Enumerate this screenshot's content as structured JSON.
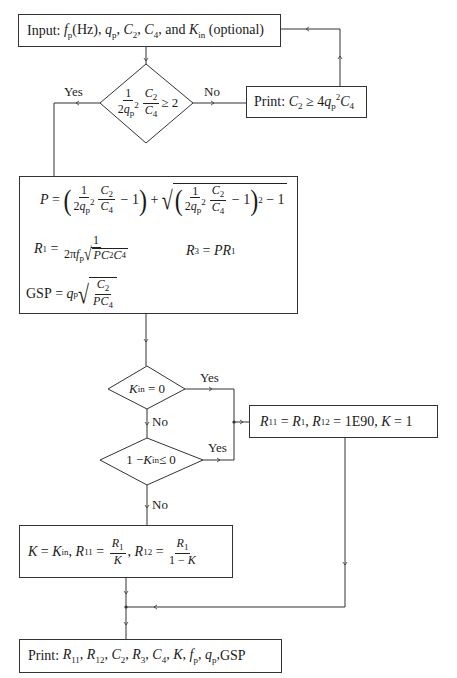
{
  "diagram": {
    "type": "flowchart",
    "nodes": {
      "input": {
        "kind": "process",
        "text": "Input: f_p(Hz), q_p, C_2, C_4, and K_in (optional)",
        "prefix": "Input: ",
        "items": [
          "f",
          "p",
          "(Hz), ",
          "q",
          "p",
          ", ",
          "C",
          "2",
          ", ",
          "C",
          "4",
          ", and ",
          "K",
          "in",
          " (optional)"
        ]
      },
      "check_ratio": {
        "kind": "decision",
        "text": "(1/(2q_p^2))(C_2/C_4) ≥ 2",
        "rhs": "≥ 2",
        "num1": "1",
        "den1": "2q",
        "num2": "C",
        "den2": "C"
      },
      "print_error": {
        "kind": "output",
        "text": "Print: C_2 ≥ 4q_p^2 C_4",
        "prefix": "Print: "
      },
      "compute": {
        "kind": "process",
        "lines": [
          "P = ((1/(2q_p^2))(C_2/C_4) − 1) + sqrt(((1/(2q_p^2))(C_2/C_4) − 1)^2 − 1)",
          "R_1 = 1/(2π f_p sqrt(P C_2 C_4))",
          "R_3 = P R_1",
          "GSP = q_p sqrt(C_2/(P C_4))"
        ]
      },
      "check_kin_zero": {
        "kind": "decision",
        "text": "K_in = 0",
        "rhs": "= 0"
      },
      "check_kin_ge_one": {
        "kind": "decision",
        "text": "1 − K_in ≤ 0",
        "lhs": "1 − ",
        "rhs": " ≤ 0"
      },
      "default_k": {
        "kind": "process",
        "text": "R_11 = R_1, R_12 = 1E90, K = 1",
        "value": "1E90"
      },
      "set_k": {
        "kind": "process",
        "text": "K = K_in, R_11 = R_1/K, R_12 = R_1/(1 − K)"
      },
      "print_result": {
        "kind": "output",
        "text": "Print: R_11, R_12, C_2, R_3, C_4, K, f_p, q_p, GSP",
        "prefix": "Print: ",
        "tail": "GSP"
      }
    },
    "labels": {
      "yes": "Yes",
      "no": "No"
    },
    "edges": [
      {
        "from": "input",
        "to": "check_ratio"
      },
      {
        "from": "check_ratio",
        "to": "compute",
        "label": "Yes"
      },
      {
        "from": "check_ratio",
        "to": "print_error",
        "label": "No"
      },
      {
        "from": "print_error",
        "to": "input"
      },
      {
        "from": "compute",
        "to": "check_kin_zero"
      },
      {
        "from": "check_kin_zero",
        "to": "default_k",
        "label": "Yes"
      },
      {
        "from": "check_kin_zero",
        "to": "check_kin_ge_one",
        "label": "No"
      },
      {
        "from": "check_kin_ge_one",
        "to": "default_k",
        "label": "Yes"
      },
      {
        "from": "check_kin_ge_one",
        "to": "set_k",
        "label": "No"
      },
      {
        "from": "set_k",
        "to": "print_result"
      },
      {
        "from": "default_k",
        "to": "print_result"
      }
    ],
    "colors": {
      "line": "#333333",
      "text": "#1a1a1a",
      "background": "#ffffff"
    }
  }
}
